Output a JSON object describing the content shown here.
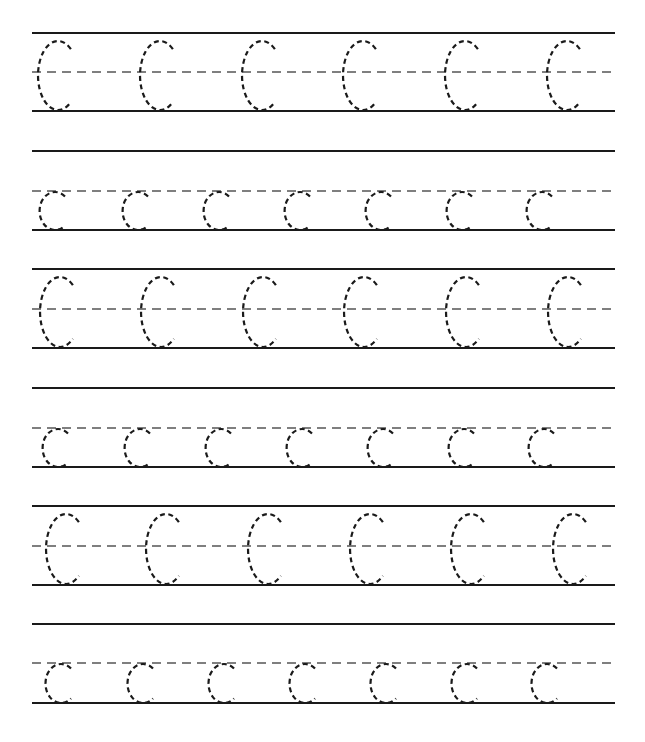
{
  "worksheet": {
    "letter": "C",
    "ink_color": "#1a1a1a",
    "guide_color": "#555555",
    "line_x_start": 32,
    "line_x_end": 615,
    "rows": [
      {
        "case": "upper",
        "top": 33,
        "mid": 72,
        "base": 111,
        "centers": [
          58,
          160,
          262,
          363,
          465,
          567
        ]
      },
      {
        "case": "lower",
        "top": 151,
        "mid": 191,
        "base": 230,
        "centers": [
          55,
          138,
          219,
          300,
          381,
          462,
          542
        ]
      },
      {
        "case": "upper",
        "top": 269,
        "mid": 309,
        "base": 348,
        "centers": [
          60,
          161,
          263,
          364,
          466,
          568
        ]
      },
      {
        "case": "lower",
        "top": 388,
        "mid": 428,
        "base": 467,
        "centers": [
          58,
          140,
          221,
          302,
          383,
          464,
          544
        ]
      },
      {
        "case": "upper",
        "top": 506,
        "mid": 546,
        "base": 585,
        "centers": [
          66,
          166,
          268,
          370,
          471,
          573
        ]
      },
      {
        "case": "lower",
        "top": 624,
        "mid": 663,
        "base": 703,
        "centers": [
          61,
          143,
          224,
          305,
          386,
          467,
          547
        ]
      }
    ]
  }
}
